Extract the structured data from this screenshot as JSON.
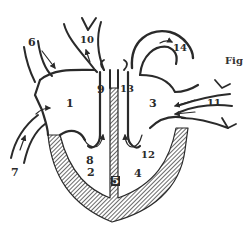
{
  "figure": {
    "caption_fragment": "Fig",
    "colors": {
      "ink": "#2a2a2a",
      "background": "#ffffff"
    }
  },
  "labels": [
    {
      "id": "1",
      "text": "1",
      "x": 66,
      "y": 98
    },
    {
      "id": "2",
      "text": "2",
      "x": 87,
      "y": 167
    },
    {
      "id": "3",
      "text": "3",
      "x": 149,
      "y": 98
    },
    {
      "id": "4",
      "text": "4",
      "x": 134,
      "y": 168
    },
    {
      "id": "5",
      "text": "5",
      "x": 113,
      "y": 176
    },
    {
      "id": "6",
      "text": "6",
      "x": 28,
      "y": 37
    },
    {
      "id": "7",
      "text": "7",
      "x": 11,
      "y": 167
    },
    {
      "id": "8",
      "text": "8",
      "x": 86,
      "y": 155
    },
    {
      "id": "9",
      "text": "9",
      "x": 97,
      "y": 84
    },
    {
      "id": "10",
      "text": "10",
      "x": 80,
      "y": 35
    },
    {
      "id": "11",
      "text": "11",
      "x": 207,
      "y": 98
    },
    {
      "id": "12",
      "text": "12",
      "x": 141,
      "y": 150
    },
    {
      "id": "13",
      "text": "13",
      "x": 120,
      "y": 84
    },
    {
      "id": "14",
      "text": "14",
      "x": 173,
      "y": 43
    }
  ]
}
